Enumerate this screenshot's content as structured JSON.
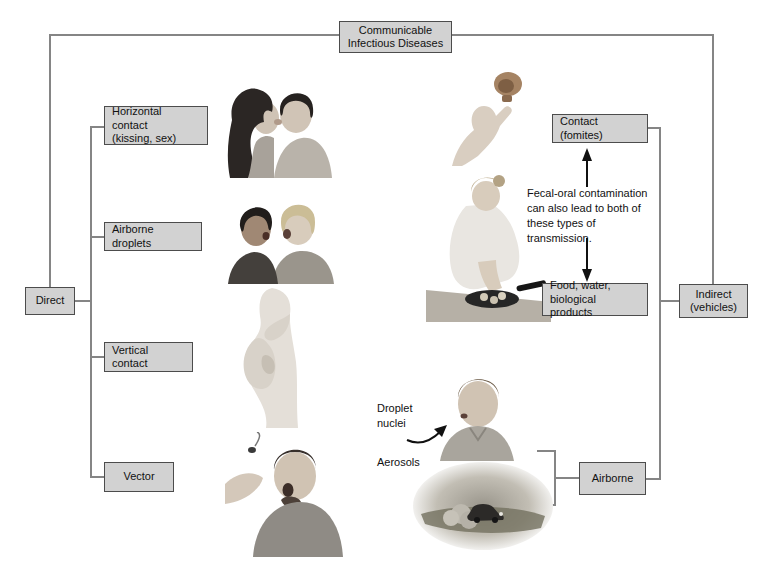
{
  "title": "Communicable\nInfectious Diseases",
  "direct_branch": {
    "label": "Direct",
    "children": [
      "Horizontal contact\n(kissing, sex)",
      "Airborne droplets",
      "Vertical contact",
      "Vector"
    ]
  },
  "indirect_branch": {
    "label": "Indirect\n(vehicles)",
    "children": [
      "Contact (fomites)",
      "Food, water,\nbiological products",
      "Airborne"
    ]
  },
  "notes": {
    "fecal_oral": "Fecal-oral contamination\ncan also lead to both of\nthese types of transmission.",
    "droplet_nuclei": "Droplet\nnuclei",
    "aerosols": "Aerosols"
  },
  "illustrations": {
    "kissing_couple": "couple kissing",
    "talking_pair": "two people talking face to face",
    "pregnant_woman": "pregnant woman with fetus",
    "man_swatting_insect": "man reacting to flying insect vector",
    "hand_doorknob": "hand touching doorknob fomite",
    "woman_cooking": "woman handling food in frying pan",
    "man_droplet_nuclei": "man exhaling droplet nuclei",
    "car_dust": "car raising dust aerosols"
  },
  "colors": {
    "box_fill": "#d2d2d2",
    "box_border": "#4c4c4c",
    "connector": "#858585",
    "arrow": "#111111",
    "background": "#ffffff"
  }
}
